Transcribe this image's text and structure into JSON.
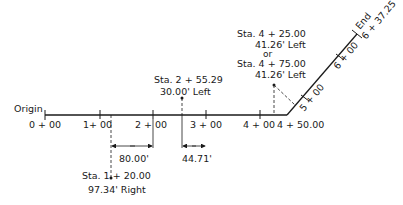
{
  "diagram": {
    "origin_label": "Origin",
    "stations_main": [
      {
        "label": "0 + 00",
        "x": 45
      },
      {
        "label": "1+ 00",
        "x": 100
      },
      {
        "label": "2 + 00",
        "x": 153
      },
      {
        "label": "3 + 00",
        "x": 206
      },
      {
        "label": "4 + 00",
        "x": 260
      }
    ],
    "vertex_label": "4 + 50.00",
    "diagonal_stations": [
      {
        "label": "5 + 00"
      },
      {
        "label": "6 + 00"
      }
    ],
    "end_label": "End",
    "end_station": "6 + 37.25",
    "point_a": {
      "station": "Sta. 1 + 20.00",
      "offset": "97.34' Right"
    },
    "point_b": {
      "station": "Sta. 2 + 55.29",
      "offset": "30.00' Left"
    },
    "point_c": {
      "station1": "Sta. 4 + 25.00",
      "offset1": "41.26' Left",
      "or_label": "or",
      "station2": "Sta. 4 + 75.00",
      "offset2": "41.26' Left"
    },
    "dimensions": [
      {
        "label": "80.00'"
      },
      {
        "label": "44.71'"
      }
    ],
    "colors": {
      "line": "#1a1a1a",
      "background": "#ffffff"
    }
  }
}
